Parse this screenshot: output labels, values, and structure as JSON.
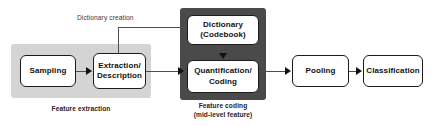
{
  "diagram": {
    "boxes": {
      "sampling": {
        "label": "Sampling"
      },
      "extraction": {
        "line1": "Extraction/",
        "line2": "Description"
      },
      "dictionary": {
        "line1": "Dictionary",
        "line2": "(Codebook)"
      },
      "quantification": {
        "line1": "Quantification/",
        "line2": "Coding"
      },
      "pooling": {
        "label": "Pooling"
      },
      "classification": {
        "label": "Classification"
      }
    },
    "labels": {
      "dictionary_creation": "Dictionary creation"
    },
    "captions": {
      "feature_extraction": "Feature extraction",
      "feature_coding_line1": "Feature coding",
      "feature_coding_line2": "(mid-level feature)"
    },
    "colors": {
      "background": "#ffffff",
      "panel_light": "#d4d4d4",
      "panel_dark": "#4a4a4a",
      "box_fill": "#ffffff",
      "box_border": "#1c1c1c",
      "connector": "#4d4d4d",
      "text": "#111111"
    }
  }
}
